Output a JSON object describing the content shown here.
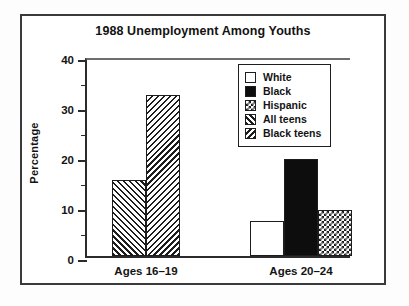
{
  "chart_data": {
    "type": "bar",
    "title": "1988 Unemployment Among Youths",
    "xlabel": "",
    "ylabel": "Percentage",
    "ylim": [
      0,
      40
    ],
    "yticks": [
      0,
      10,
      20,
      30,
      40
    ],
    "ytick_labels": [
      "0",
      "10",
      "20",
      "30",
      "40"
    ],
    "yminor_ticks": [
      5,
      15,
      25,
      35
    ],
    "grid": false,
    "legend_position": "upper right",
    "categories": [
      "Ages 16–19",
      "Ages 20–24"
    ],
    "series": [
      {
        "name": "White",
        "pattern": "empty",
        "values": [
          null,
          7.0
        ]
      },
      {
        "name": "Black",
        "pattern": "solid",
        "values": [
          null,
          19.5
        ]
      },
      {
        "name": "Hispanic",
        "pattern": "check",
        "values": [
          null,
          9.2
        ]
      },
      {
        "name": "All teens",
        "pattern": "diag-up",
        "values": [
          15.2,
          null
        ]
      },
      {
        "name": "Black teens",
        "pattern": "diag-down",
        "values": [
          32.2,
          null
        ]
      }
    ],
    "bars": [
      {
        "group": "Ages 16–19",
        "series": "All teens",
        "value": 15.2,
        "pattern": "diag-up",
        "x": 25,
        "width": 34
      },
      {
        "group": "Ages 16–19",
        "series": "Black teens",
        "value": 32.2,
        "pattern": "diag-down",
        "x": 59,
        "width": 34
      },
      {
        "group": "Ages 20–24",
        "series": "White",
        "value": 7.0,
        "pattern": "empty",
        "x": 163,
        "width": 34
      },
      {
        "group": "Ages 20–24",
        "series": "Black",
        "value": 19.5,
        "pattern": "solid",
        "x": 197,
        "width": 34
      },
      {
        "group": "Ages 20–24",
        "series": "Hispanic",
        "value": 9.2,
        "pattern": "check",
        "x": 231,
        "width": 34
      }
    ],
    "group_label_centers": [
      59,
      214
    ],
    "legend_entries": [
      {
        "label": "White",
        "pattern": "empty"
      },
      {
        "label": "Black",
        "pattern": "solid"
      },
      {
        "label": "Hispanic",
        "pattern": "check"
      },
      {
        "label": "All teens",
        "pattern": "diag-up"
      },
      {
        "label": "Black teens",
        "pattern": "diag-down"
      }
    ],
    "colors": {
      "axis": "#2b2b2b",
      "frame": "#3a3a3a",
      "text": "#141414",
      "bar_fill_solid": "#0d0d0d",
      "bar_fill_empty": "#ffffff",
      "background": "#ffffff"
    }
  }
}
